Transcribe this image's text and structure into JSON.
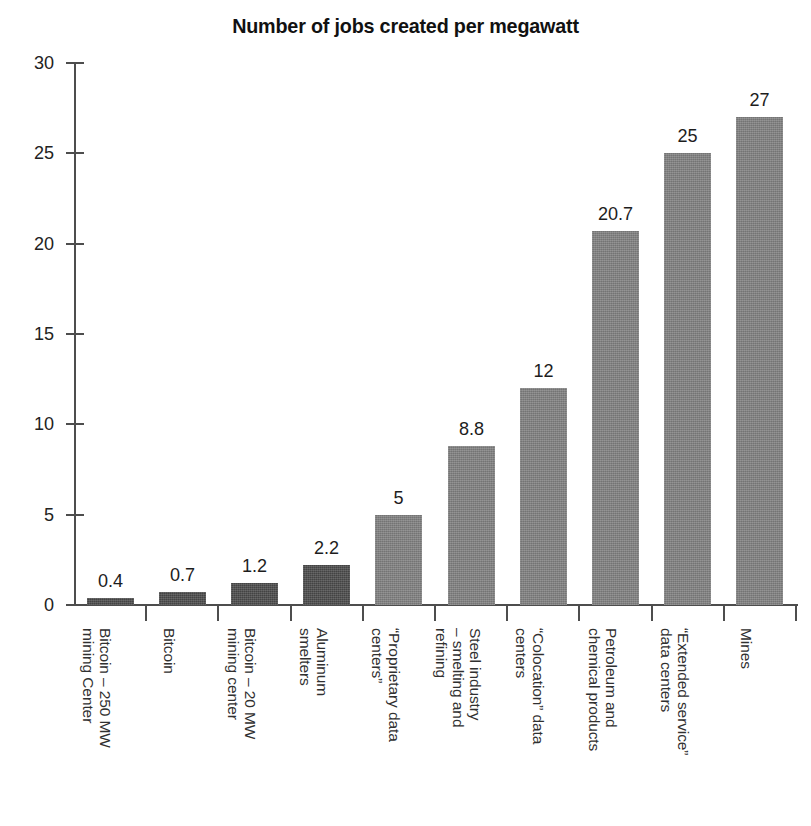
{
  "chart_data": {
    "type": "bar",
    "title": "Number of jobs created per megawatt",
    "xlabel": "",
    "ylabel": "",
    "ylim": [
      0,
      30
    ],
    "ytick_values": [
      0,
      5,
      10,
      15,
      20,
      25,
      30
    ],
    "ytick_labels": [
      "0",
      "5",
      "10",
      "15",
      "20",
      "25",
      "30"
    ],
    "grid": false,
    "legend": "none",
    "categories": [
      "Bitcoin – 250 MW mining Center",
      "Bitcoin",
      "Bitcoin – 20 MW mining center",
      "Aluminum smelters",
      "“Proprietary data centers”",
      "Steel industry – smelting and refining",
      "“Colocation” data centers",
      "Petroleum and chemical products",
      "“Extended service” data centers",
      "Mines"
    ],
    "category_lines": [
      [
        "Bitcoin – 250 MW",
        "mining Center"
      ],
      [
        "Bitcoin"
      ],
      [
        "Bitcoin – 20 MW",
        "mining center"
      ],
      [
        "Aluminum",
        "smelters"
      ],
      [
        "“Proprietary data",
        "centers”"
      ],
      [
        "Steel industry",
        "– smelting and",
        "refining"
      ],
      [
        "“Colocation” data",
        "centers"
      ],
      [
        "Petroleum and",
        "chemical products"
      ],
      [
        "“Extended service”",
        "data centers"
      ],
      [
        "Mines"
      ]
    ],
    "values": [
      0.4,
      0.7,
      1.2,
      2.2,
      5,
      8.8,
      12,
      20.7,
      25,
      27
    ],
    "value_labels": [
      "0.4",
      "0.7",
      "1.2",
      "2.2",
      "5",
      "8.8",
      "12",
      "20.7",
      "25",
      "27"
    ],
    "bar_colors": [
      "#4a4a4a",
      "#4a4a4a",
      "#4a4a4a",
      "#4a4a4a",
      "#7f7f7f",
      "#7f7f7f",
      "#7f7f7f",
      "#7f7f7f",
      "#7f7f7f",
      "#7f7f7f"
    ],
    "highlight_color": "#4a4a4a",
    "base_color": "#7f7f7f",
    "axis_color": "#4d4d4d",
    "text_color": "#1d1d1d",
    "background_color": "#ffffff"
  }
}
